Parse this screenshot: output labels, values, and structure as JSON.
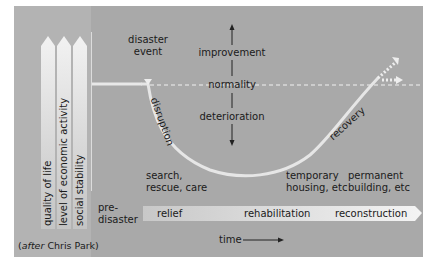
{
  "diagram": {
    "attribution": {
      "prefix": "after",
      "name": "Chris Park"
    },
    "vertical_indicators": [
      {
        "label": "quality of life"
      },
      {
        "label": "level of economic activity"
      },
      {
        "label": "social stability"
      }
    ],
    "axis": {
      "improvement": "improvement",
      "normality": "normality",
      "deterioration": "deterioration",
      "time": "time"
    },
    "curve_labels": {
      "event": [
        "disaster",
        "event"
      ],
      "disruption": "disruption",
      "recovery": "recovery"
    },
    "stage_notes": [
      {
        "line1": "search,",
        "line2": "rescue, care"
      },
      {
        "line1": "temporary",
        "line2": "housing, etc"
      },
      {
        "line1": "permanent",
        "line2": "building, etc"
      }
    ],
    "phases": {
      "pre": [
        "pre-",
        "disaster"
      ],
      "items": [
        "relief",
        "rehabilitation",
        "reconstruction"
      ]
    },
    "colors": {
      "panel": "#a9a9a9",
      "left_strip": "#b3b3b3",
      "curve": "#e6e6e6",
      "text": "#1a1a1a"
    }
  }
}
